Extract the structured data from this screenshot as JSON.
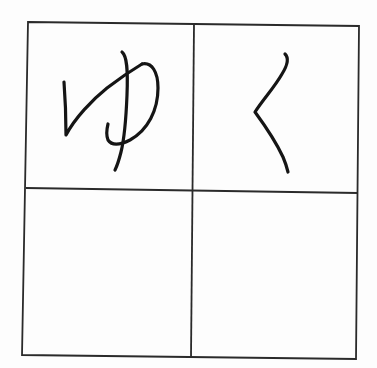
{
  "worksheet": {
    "type": "handwriting practice grid",
    "rows": 2,
    "columns": 2,
    "line_color": "#2a2a2a",
    "ink_color": "#151515",
    "cells": [
      {
        "row": 1,
        "col": 1,
        "character": "ゆ",
        "filled": true
      },
      {
        "row": 1,
        "col": 2,
        "character": "く",
        "filled": true
      },
      {
        "row": 2,
        "col": 1,
        "character": "",
        "filled": false
      },
      {
        "row": 2,
        "col": 2,
        "character": "",
        "filled": false
      }
    ]
  }
}
